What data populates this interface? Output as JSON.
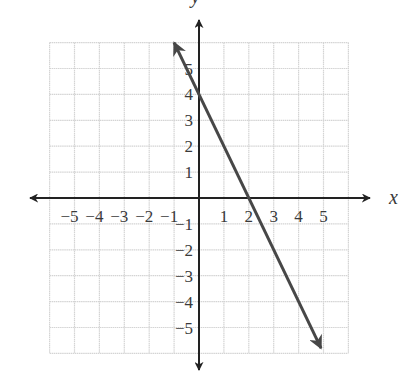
{
  "chart_data": {
    "type": "line",
    "title": "",
    "xlabel": "x",
    "ylabel": "y",
    "xlim": [
      -6,
      6
    ],
    "ylim": [
      -6,
      6
    ],
    "grid": true,
    "x_ticks": [
      -5,
      -4,
      -3,
      -2,
      -1,
      1,
      2,
      3,
      4,
      5
    ],
    "y_ticks": [
      -5,
      -4,
      -3,
      -2,
      -1,
      1,
      2,
      3,
      4,
      5
    ],
    "series": [
      {
        "name": "y = -2x + 4",
        "equation": "y = -2x + 4",
        "slope": -2,
        "y_intercept": 4,
        "x_intercept": 2,
        "arrows_both_ends": true,
        "x": [
          -1.0,
          4.9
        ],
        "y": [
          6.0,
          -5.8
        ]
      }
    ],
    "legend": null
  },
  "colors": {
    "grid": "#d4d4d4",
    "axes": "#222222",
    "line": "#474747",
    "text": "#3a3a3a"
  },
  "labels": {
    "x_axis": "x",
    "y_axis": "y"
  }
}
